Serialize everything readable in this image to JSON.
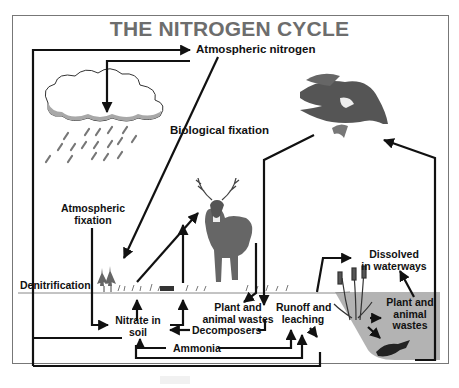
{
  "diagram": {
    "title": "THE NITROGEN CYCLE",
    "labels": {
      "atmospheric_nitrogen": "Atmospheric nitrogen",
      "biological_fixation": "Biological fixation",
      "atmospheric_fixation_1": "Atmospheric",
      "atmospheric_fixation_2": "fixation",
      "denitrification": "Denitrification",
      "nitrate_1": "Nitrate in",
      "nitrate_2": "soil",
      "plant_wastes_1": "Plant and",
      "plant_wastes_2": "animal wastes",
      "decomposers": "Decomposers",
      "ammonia": "Ammonia",
      "runoff_1": "Runoff and",
      "runoff_2": "leaching",
      "dissolved_1": "Dissolved",
      "dissolved_2": "in waterways",
      "water_wastes_1": "Plant and",
      "water_wastes_2": "animal",
      "water_wastes_3": "wastes"
    },
    "illustrations": [
      "cloud-with-rain",
      "bald-eagle-with-fish",
      "white-tailed-deer",
      "grass-and-trees",
      "cattails-in-pond",
      "fish"
    ],
    "colors": {
      "title": "#6d6d6d",
      "arrow": "#111111",
      "water": "#b3b3b3",
      "cloud_shadow": "#a8a8a8",
      "frame": "#777777"
    }
  }
}
